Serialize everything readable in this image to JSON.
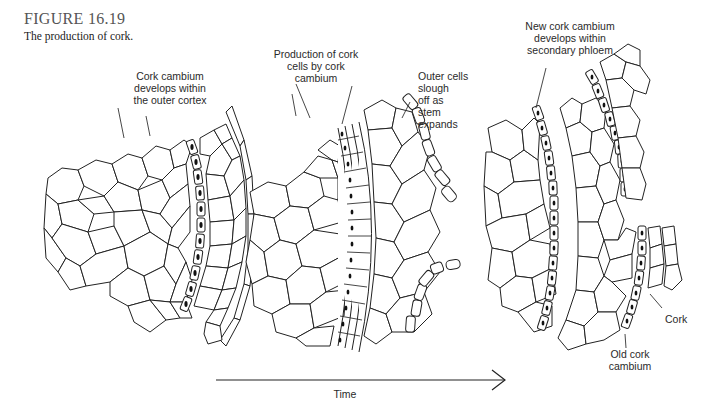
{
  "figure": {
    "number": "FIGURE 16.19",
    "caption": "The production of cork."
  },
  "panels": [
    {
      "id": "stage-1",
      "label": "Cork cambium\ndevelops within\nthe outer cortex"
    },
    {
      "id": "stage-2",
      "label": "Production of cork\ncells by cork\ncambium",
      "label_secondary": "Outer cells\nslough\noff as\nstem\nexpands"
    },
    {
      "id": "stage-3",
      "label": "New cork cambium\ndevelops within\nsecondary phloem",
      "label_cork": "Cork",
      "label_old": "Old cork\ncambium"
    }
  ],
  "time_axis": {
    "label": "Time",
    "direction": "left-to-right"
  },
  "colors": {
    "line": "#222222",
    "nucleus": "#111111",
    "background": "#ffffff",
    "title": "#555555"
  }
}
